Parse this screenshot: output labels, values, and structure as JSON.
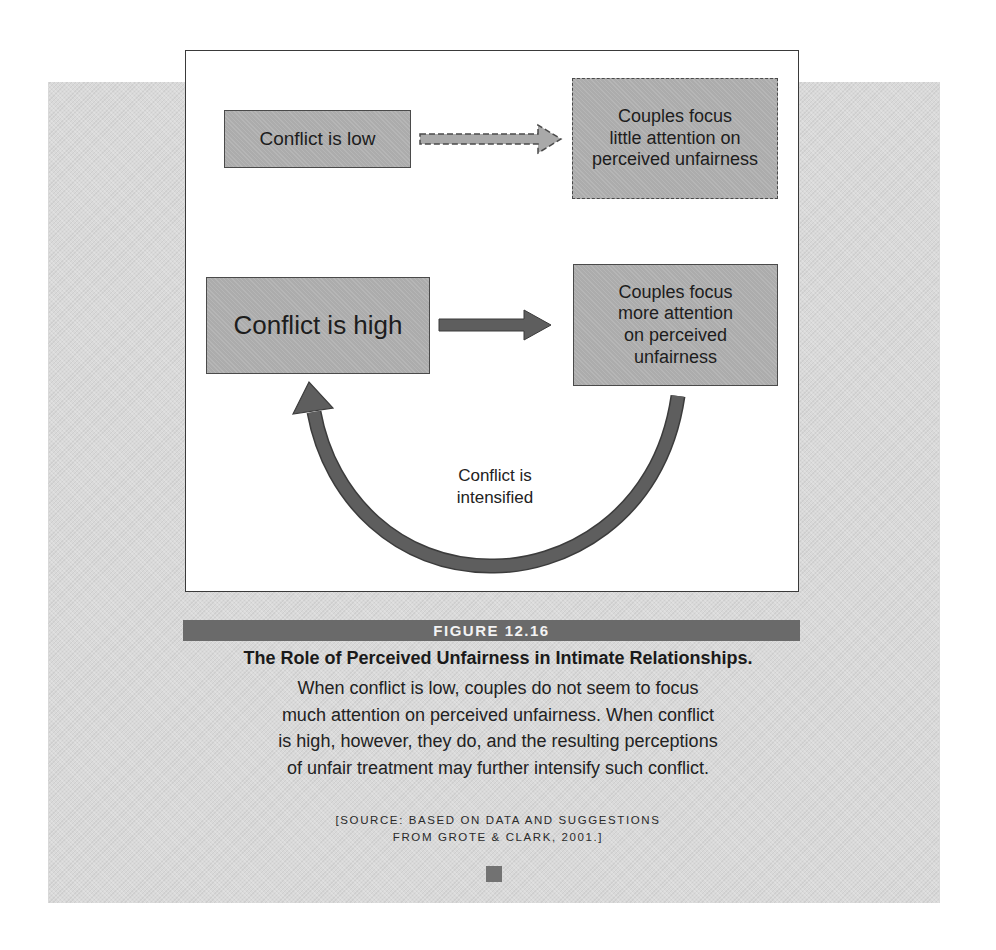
{
  "diagram": {
    "nodes": [
      {
        "id": "low",
        "label": "Conflict is low",
        "style": "solid"
      },
      {
        "id": "little",
        "lines": [
          "Couples focus",
          "little attention on",
          "perceived unfairness"
        ],
        "style": "dashed"
      },
      {
        "id": "high",
        "label": "Conflict is high",
        "style": "solid"
      },
      {
        "id": "more",
        "lines": [
          "Couples focus",
          "more attention",
          "on perceived",
          "unfairness"
        ],
        "style": "solid"
      }
    ],
    "edges": [
      {
        "from": "low",
        "to": "little",
        "style": "dashed"
      },
      {
        "from": "high",
        "to": "more",
        "style": "solid"
      },
      {
        "from": "more",
        "to": "high",
        "style": "curved",
        "label": [
          "Conflict is",
          "intensified"
        ]
      }
    ],
    "colors": {
      "panel_bg": "#d9d9d9",
      "node_fill": "#acacac",
      "arrow_fill": "#5e5e5e",
      "figure_bar": "#6a6a6a"
    }
  },
  "caption": {
    "figure_number": "FIGURE 12.16",
    "title": "The Role of Perceived Unfairness in Intimate Relationships.",
    "body_lines": [
      "When conflict is low, couples do not seem to focus",
      "much attention on perceived unfairness. When conflict",
      "is high, however, they do, and the resulting perceptions",
      "of unfair treatment may further intensify such conflict."
    ],
    "source_lines": [
      "[SOURCE: BASED ON DATA AND SUGGESTIONS",
      "FROM GROTE & CLARK, 2001.]"
    ]
  }
}
